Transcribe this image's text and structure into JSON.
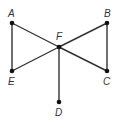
{
  "diagram": {
    "type": "graph",
    "colors": {
      "edge": "#333333",
      "vertex": "#111111",
      "label": "#333333"
    },
    "vertices": [
      {
        "id": "A",
        "label": "A",
        "x": 12,
        "y": 23,
        "lx": 8,
        "ly": 17
      },
      {
        "id": "B",
        "label": "B",
        "x": 107,
        "y": 23,
        "lx": 104,
        "ly": 17
      },
      {
        "id": "F",
        "label": "F",
        "x": 59,
        "y": 47,
        "lx": 56,
        "ly": 40
      },
      {
        "id": "E",
        "label": "E",
        "x": 12,
        "y": 71,
        "lx": 8,
        "ly": 85
      },
      {
        "id": "C",
        "label": "C",
        "x": 107,
        "y": 71,
        "lx": 103,
        "ly": 85
      },
      {
        "id": "D",
        "label": "D",
        "x": 59,
        "y": 102,
        "lx": 55,
        "ly": 116
      }
    ],
    "edges": [
      [
        "A",
        "E"
      ],
      [
        "A",
        "F"
      ],
      [
        "F",
        "C"
      ],
      [
        "E",
        "F"
      ],
      [
        "F",
        "B"
      ],
      [
        "B",
        "C"
      ],
      [
        "F",
        "D"
      ]
    ]
  }
}
